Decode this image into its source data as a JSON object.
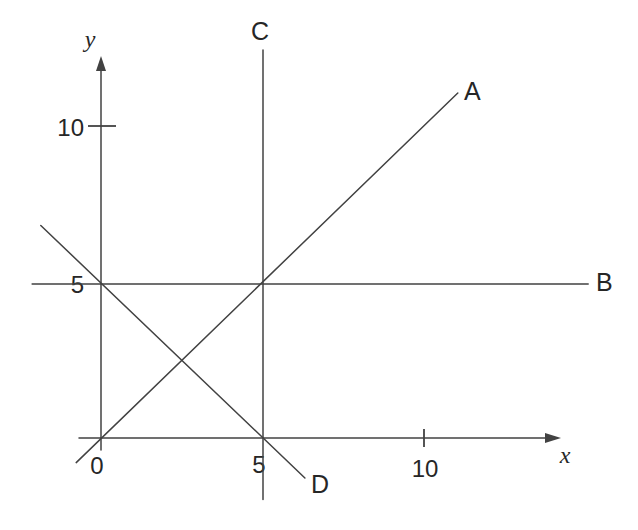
{
  "figure": {
    "background": "#ffffff",
    "line_color": "#424242",
    "text_color": "#262626"
  },
  "chart_data": {
    "type": "line",
    "title": "",
    "xlabel": "x",
    "ylabel": "y",
    "grid": false,
    "legend": "labels at line ends",
    "axes": {
      "x": {
        "label": "x",
        "tick_values": [
          5,
          10
        ],
        "tick_labels": [
          "5",
          "10"
        ],
        "range": [
          -0.7,
          14.2
        ]
      },
      "y": {
        "label": "y",
        "tick_values": [
          5,
          10
        ],
        "tick_labels": [
          "5",
          "10"
        ],
        "range": [
          -0.4,
          12.4
        ]
      },
      "origin_label": "0"
    },
    "series": [
      {
        "name": "A",
        "points": [
          [
            -0.8,
            -0.8
          ],
          [
            11.05,
            11.2
          ]
        ]
      },
      {
        "name": "B",
        "points": [
          [
            -2.17,
            5.0
          ],
          [
            15.1,
            5.0
          ]
        ]
      },
      {
        "name": "C",
        "points": [
          [
            5.0,
            -2.0
          ],
          [
            5.0,
            12.6
          ]
        ]
      },
      {
        "name": "D",
        "points": [
          [
            -1.9,
            6.9
          ],
          [
            6.3,
            -1.3
          ]
        ]
      }
    ]
  }
}
